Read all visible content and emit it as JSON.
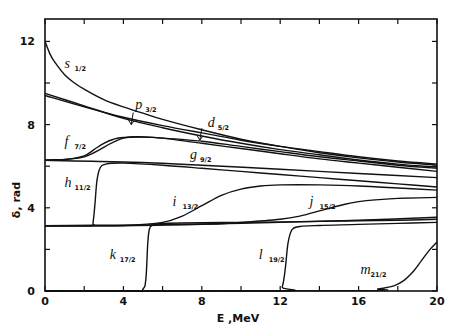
{
  "chart_data": {
    "type": "line",
    "title": "",
    "xlabel": "E ,MeV",
    "ylabel": "δ, rad",
    "xlim": [
      0,
      20
    ],
    "ylim": [
      0,
      13.2
    ],
    "grid": false,
    "legend": "inline curve labels",
    "x_ticks": [
      0,
      4,
      8,
      12,
      16,
      20
    ],
    "x_minor_ticks": [
      2,
      6,
      10,
      14,
      18
    ],
    "y_ticks": [
      0,
      4,
      8,
      12
    ],
    "y_minor_ticks": [
      2,
      6,
      10
    ],
    "series": [
      {
        "name": "s1/2",
        "label": "s",
        "sub": "1/2",
        "label_pos": [
          1.0,
          10.7
        ],
        "x": [
          0,
          0.25,
          0.5,
          1,
          1.5,
          2,
          3,
          4,
          5,
          6,
          8,
          10,
          12,
          14,
          16,
          18,
          20
        ],
        "y": [
          12.0,
          11.4,
          11.0,
          10.4,
          10.0,
          9.7,
          9.2,
          8.85,
          8.55,
          8.25,
          7.75,
          7.3,
          6.95,
          6.65,
          6.4,
          6.2,
          6.05
        ]
      },
      {
        "name": "p3/2",
        "label": "p",
        "sub": "3/2",
        "label_pos": [
          4.6,
          8.75
        ],
        "arrow_at": [
          4.4,
          8.0
        ],
        "x": [
          0,
          2,
          4,
          6,
          8,
          10,
          12,
          14,
          16,
          18,
          20
        ],
        "y": [
          9.4,
          8.85,
          8.35,
          7.95,
          7.6,
          7.25,
          6.95,
          6.7,
          6.45,
          6.25,
          6.1
        ]
      },
      {
        "name": "p1/2",
        "label": "",
        "sub": "",
        "x": [
          0,
          2,
          4,
          6,
          8,
          10,
          12,
          14,
          16,
          18,
          20
        ],
        "y": [
          9.5,
          8.9,
          8.3,
          7.85,
          7.45,
          7.1,
          6.8,
          6.55,
          6.3,
          6.1,
          5.95
        ]
      },
      {
        "name": "d5/2",
        "label": "d",
        "sub": "5/2",
        "label_pos": [
          8.3,
          7.9
        ],
        "arrow_at": [
          7.9,
          7.25
        ],
        "x": [
          0,
          2,
          4,
          6,
          8,
          10,
          12,
          14,
          16,
          18,
          20
        ],
        "y": [
          6.3,
          6.45,
          7.35,
          7.35,
          7.2,
          6.95,
          6.7,
          6.45,
          6.25,
          6.05,
          5.9
        ]
      },
      {
        "name": "f7/2",
        "label": "f",
        "sub": "7/2",
        "label_pos": [
          1.0,
          6.95
        ],
        "x": [
          0,
          1,
          2,
          2.5,
          3,
          3.5,
          4,
          5,
          6,
          8,
          10,
          12,
          14,
          16,
          18,
          20
        ],
        "y": [
          6.28,
          6.32,
          6.5,
          6.8,
          7.1,
          7.3,
          7.38,
          7.4,
          7.35,
          7.1,
          6.85,
          6.6,
          6.35,
          6.15,
          5.95,
          5.75
        ]
      },
      {
        "name": "g9/2",
        "label": "g",
        "sub": "9/2",
        "label_pos": [
          7.4,
          6.35
        ],
        "x": [
          0,
          4,
          8,
          12,
          16,
          20
        ],
        "y": [
          6.28,
          6.2,
          6.05,
          5.85,
          5.65,
          5.45
        ]
      },
      {
        "name": "h11/2",
        "label": "h",
        "sub": "11/2",
        "label_pos": [
          1.0,
          5.0
        ],
        "x": [
          0,
          2.3,
          2.45,
          2.55,
          2.65,
          2.8,
          3.1,
          4,
          6,
          8,
          10,
          12,
          14,
          16,
          18,
          20
        ],
        "y": [
          3.14,
          3.14,
          3.3,
          4.2,
          5.3,
          5.9,
          6.1,
          6.15,
          6.05,
          5.9,
          5.75,
          5.6,
          5.45,
          5.3,
          5.15,
          5.0
        ]
      },
      {
        "name": "i13/2",
        "label": "i",
        "sub": "13/2",
        "label_pos": [
          6.5,
          4.1
        ],
        "x": [
          0,
          2,
          4,
          6,
          7,
          8,
          9,
          10,
          11,
          12,
          14,
          16,
          18,
          20
        ],
        "y": [
          3.14,
          3.14,
          3.15,
          3.3,
          3.6,
          4.1,
          4.6,
          4.9,
          5.05,
          5.1,
          5.1,
          5.05,
          4.95,
          4.85
        ]
      },
      {
        "name": "j15/2",
        "label": "j",
        "sub": "15/2",
        "label_pos": [
          13.5,
          4.1
        ],
        "x": [
          0,
          4,
          8,
          10,
          12,
          13,
          14,
          15,
          16,
          18,
          20
        ],
        "y": [
          3.14,
          3.14,
          3.2,
          3.3,
          3.45,
          3.6,
          3.85,
          4.1,
          4.3,
          4.45,
          4.5
        ]
      },
      {
        "name": "baseline-pi",
        "label": "",
        "sub": "",
        "x": [
          0,
          4,
          8,
          12,
          16,
          20
        ],
        "y": [
          3.14,
          3.17,
          3.22,
          3.3,
          3.4,
          3.55
        ]
      },
      {
        "name": "k17/2",
        "label": "k",
        "sub": "17/2",
        "label_pos": [
          3.3,
          1.55
        ],
        "x": [
          0,
          4.5,
          5.0,
          5.15,
          5.25,
          5.35,
          5.6,
          6,
          8,
          10,
          12,
          14,
          16,
          18,
          20
        ],
        "y": [
          0,
          0,
          0.1,
          0.6,
          2.4,
          3.05,
          3.2,
          3.25,
          3.28,
          3.3,
          3.32,
          3.35,
          3.38,
          3.4,
          3.45
        ]
      },
      {
        "name": "l19/2",
        "label": "l",
        "sub": "19/2",
        "label_pos": [
          10.9,
          1.55
        ],
        "x": [
          0,
          11.8,
          12.1,
          12.25,
          12.4,
          12.6,
          13,
          14,
          16,
          18,
          20
        ],
        "y": [
          0,
          0,
          0.2,
          1.0,
          2.3,
          2.95,
          3.1,
          3.15,
          3.2,
          3.25,
          3.3
        ]
      },
      {
        "name": "m21/2",
        "label": "m",
        "sub": "21/2",
        "label_pos": [
          16.1,
          0.8
        ],
        "x": [
          0,
          16,
          17,
          17.8,
          18.3,
          18.8,
          19.2,
          19.6,
          20
        ],
        "y": [
          0,
          0.02,
          0.1,
          0.25,
          0.5,
          0.95,
          1.45,
          1.95,
          2.35
        ]
      }
    ]
  }
}
